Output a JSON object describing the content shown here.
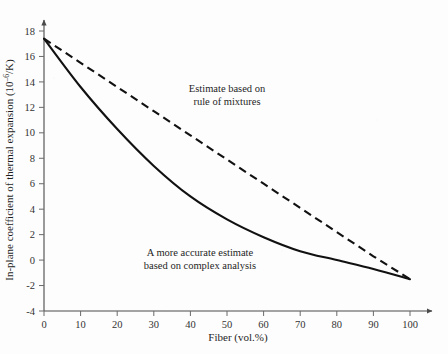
{
  "figure": {
    "background_color": "#fdfdfd",
    "ink_color": "#111111"
  },
  "chart_data": {
    "type": "line",
    "title": "",
    "xlabel": "Fiber (vol.%)",
    "ylabel_parts": {
      "lead": "In-plane coefficient of thermal expansion (10",
      "exponent": "–6",
      "tail": "/K)"
    },
    "ylabel": "In-plane coefficient of thermal expansion (10–6/K)",
    "xlim": [
      0,
      100
    ],
    "ylim": [
      -4,
      18
    ],
    "xticks": [
      0,
      10,
      20,
      30,
      40,
      50,
      60,
      70,
      80,
      90,
      100
    ],
    "xtick_labels": [
      "0",
      "10",
      "20",
      "30",
      "40",
      "50",
      "60",
      "70",
      "80",
      "90",
      "100"
    ],
    "yticks": [
      -4,
      -2,
      0,
      2,
      4,
      6,
      8,
      10,
      12,
      14,
      16,
      18
    ],
    "ytick_labels": [
      "-4",
      "-2",
      "0",
      "2",
      "4",
      "6",
      "8",
      "10",
      "12",
      "14",
      "16",
      "18"
    ],
    "grid": false,
    "legend_position": "none",
    "series": [
      {
        "name": "Estimate based on rule of mixtures",
        "style": "dashed",
        "color": "#111111",
        "x": [
          0,
          10,
          20,
          30,
          40,
          50,
          60,
          70,
          80,
          90,
          100
        ],
        "values": [
          17.4,
          15.5,
          13.6,
          11.7,
          9.8,
          7.9,
          6.0,
          4.1,
          2.2,
          0.3,
          -1.5
        ]
      },
      {
        "name": "A more accurate estimate based on complex analysis",
        "style": "solid",
        "color": "#111111",
        "x": [
          0,
          10,
          20,
          30,
          40,
          50,
          60,
          70,
          80,
          90,
          100
        ],
        "values": [
          17.4,
          13.6,
          10.3,
          7.4,
          5.0,
          3.2,
          1.8,
          0.7,
          0.0,
          -0.7,
          -1.5
        ]
      }
    ],
    "annotations": [
      {
        "name": "rule-of-mixtures",
        "line1": "Estimate based on",
        "line2": "rule of mixtures",
        "x_px": 227,
        "y_px": 92
      },
      {
        "name": "complex-analysis",
        "line1": "A more accurate estimate",
        "line2": "based on complex analysis",
        "x_px": 200,
        "y_px": 256
      }
    ]
  }
}
